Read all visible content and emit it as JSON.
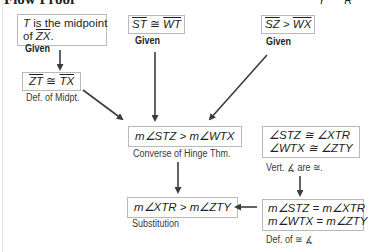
{
  "title": "Flow Proof",
  "corner_labels": "Y R",
  "statements": [
    {
      "id": "s1",
      "lines": [
        "T is the midpoint",
        "of ZX."
      ],
      "reason": "Given"
    },
    {
      "id": "s2",
      "line": "ST ≅ WT",
      "left": "ST",
      "op": "≅",
      "right": "WT",
      "reason": "Given"
    },
    {
      "id": "s3",
      "line": "SZ > WX",
      "left": "SZ",
      "op": ">",
      "right": "WX",
      "reason": "Given"
    },
    {
      "id": "s4",
      "line": "ZT ≅ TX",
      "left": "ZT",
      "op": "≅",
      "right": "TX",
      "reason": "Def. of Midpt."
    },
    {
      "id": "s5",
      "line": "m∠STZ > m∠WTX",
      "reason": "Converse of Hinge Thm."
    },
    {
      "id": "s6",
      "lines": [
        "∠STZ ≅ ∠XTR",
        "∠WTX ≅ ∠ZTY"
      ],
      "reason": "Vert. ∡ are ≅."
    },
    {
      "id": "s7",
      "lines": [
        "m∠STZ = m∠XTR",
        "m∠WTX = m∠ZTY"
      ],
      "reason": "Def. of ≅ ∡"
    },
    {
      "id": "s8",
      "line": "m∠XTR > m∠ZTY",
      "reason": "Substitution"
    }
  ],
  "s1_parts": {
    "t": "T",
    "rest": " is the midpoint",
    "of": "of ",
    "seg": "ZX",
    "dot": "."
  },
  "colors": {
    "box_border": "#b9b9b9",
    "arrow": "#3c3c3c",
    "text": "#231f20"
  }
}
